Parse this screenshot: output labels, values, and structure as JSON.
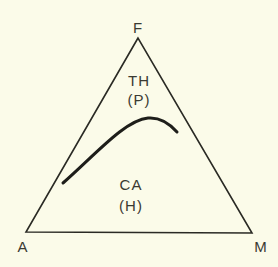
{
  "diagram": {
    "vertices": {
      "top": "F",
      "left": "A",
      "right": "M"
    },
    "regions": [
      {
        "name": "TH",
        "sub": "(P)"
      },
      {
        "name": "CA",
        "sub": "(H)"
      }
    ],
    "colors": {
      "background": "#fbfbe9",
      "line": "#2a2a24"
    }
  }
}
